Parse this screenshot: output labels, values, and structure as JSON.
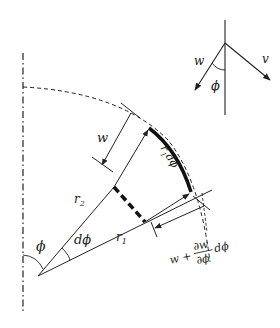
{
  "diagram": {
    "type": "differential element of a shell of revolution (meridional strip)",
    "colors": {
      "stroke": "#222222",
      "background": "#ffffff"
    },
    "labels": {
      "inset_w": "w",
      "inset_v": "v",
      "inset_phi": "ϕ",
      "w_top": "w",
      "arc_length_r": "r",
      "arc_length_sub": "1",
      "arc_length_rest": "dϕ",
      "r2": "r",
      "r2_sub": "2",
      "r1": "r",
      "r1_sub": "1",
      "phi": "ϕ",
      "dphi": "dϕ",
      "w_bottom_prefix": "w +",
      "partial_num": "∂w",
      "partial_den": "∂ϕ",
      "partial_suffix": "dϕ"
    }
  }
}
